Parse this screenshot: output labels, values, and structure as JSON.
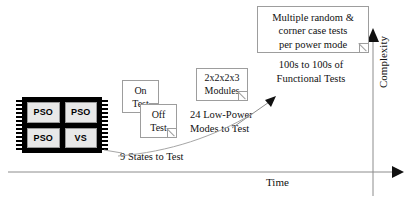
{
  "diagram": {
    "chip": {
      "name": "multi-domain-chip",
      "cells": [
        {
          "label": "PSO"
        },
        {
          "label": "PSO"
        },
        {
          "label": "PSO"
        },
        {
          "label": "VS"
        }
      ]
    },
    "notes": [
      {
        "id": "on-test",
        "line1": "On",
        "line2": "Test"
      },
      {
        "id": "off-test",
        "line1": "Off",
        "line2": "Test"
      },
      {
        "id": "modules",
        "line1": "2x2x2x3",
        "line2": "Modules"
      }
    ],
    "random_note": {
      "line1": "Multiple random &",
      "line2": "corner case tests",
      "line3": "per power mode"
    },
    "captions": {
      "states": "9 States to Test",
      "modes_line1": "24 Low-Power",
      "modes_line2": "Modes to Test",
      "functional_line1": "100s to 100s of",
      "functional_line2": "Functional Tests"
    },
    "axes": {
      "x_label": "Time",
      "y_label": "Complexity"
    },
    "colors": {
      "ink": "#111111",
      "chip_body": "#000000",
      "chip_cell": "#e8e8e8",
      "note_border": "#9d9d9d",
      "axis": "#8c8c8c",
      "connector": "#a6a6a6",
      "background": "#ffffff"
    }
  }
}
